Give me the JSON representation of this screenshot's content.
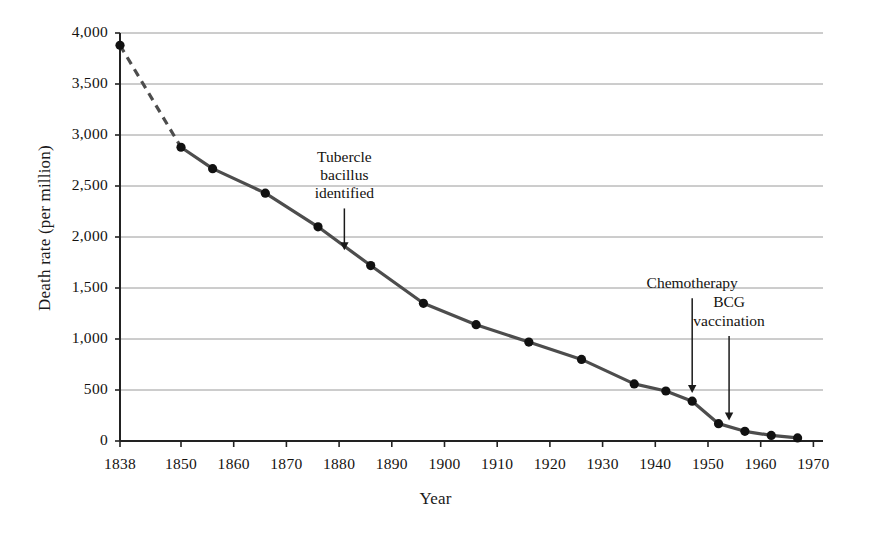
{
  "chart_data": {
    "type": "line",
    "title": "",
    "xlabel": "Year",
    "ylabel": "Death rate (per million)",
    "xlim": [
      1838,
      1970
    ],
    "ylim": [
      0,
      4000
    ],
    "grid": true,
    "legend": "none",
    "y_ticks": [
      0,
      500,
      1000,
      1500,
      2000,
      2500,
      3000,
      3500,
      4000
    ],
    "y_tick_labels": [
      "0",
      "500",
      "1,000",
      "1,500",
      "2,000",
      "2,500",
      "3,000",
      "3,500",
      "4,000"
    ],
    "x_ticks": [
      1838,
      1850,
      1860,
      1870,
      1880,
      1890,
      1900,
      1910,
      1920,
      1930,
      1940,
      1950,
      1960,
      1970
    ],
    "x_tick_labels": [
      "1838",
      "1850",
      "1860",
      "1870",
      "1880",
      "1890",
      "1900",
      "1910",
      "1920",
      "1930",
      "1940",
      "1950",
      "1960",
      "1970"
    ],
    "series": [
      {
        "name": "Tuberculosis death rate",
        "marker": "filled-circle",
        "color": "#4d4d4d",
        "x": [
          1838,
          1850,
          1856,
          1866,
          1876,
          1886,
          1896,
          1906,
          1916,
          1926,
          1936,
          1942,
          1947,
          1952,
          1957,
          1962,
          1967
        ],
        "values": [
          3880,
          2880,
          2670,
          2430,
          2100,
          1720,
          1350,
          1140,
          970,
          800,
          560,
          490,
          390,
          170,
          95,
          55,
          30
        ],
        "dashed_segment": {
          "from_x": 1838,
          "to_x": 1850,
          "style": "dashed"
        }
      }
    ],
    "annotations": [
      {
        "name": "tubercle-bacillus-identified",
        "text_lines": [
          "Tubercle",
          "bacillus",
          "identified"
        ],
        "arrow_x": 1881,
        "arrow_from_y": 2280,
        "arrow_to_y": 1870
      },
      {
        "name": "chemotherapy",
        "text_lines": [
          "Chemotherapy"
        ],
        "arrow_x": 1947,
        "arrow_from_y": 1400,
        "arrow_to_y": 470
      },
      {
        "name": "bcg-vaccination",
        "text_lines": [
          "BCG",
          "vaccination"
        ],
        "arrow_x": 1954,
        "arrow_from_y": 1030,
        "arrow_to_y": 200
      }
    ]
  }
}
